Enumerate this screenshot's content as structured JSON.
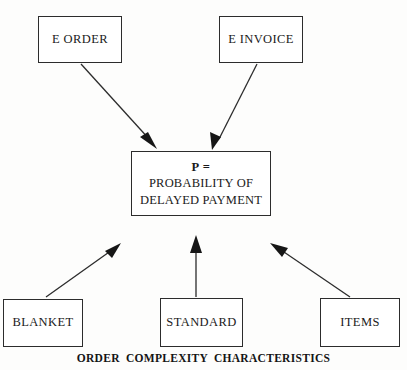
{
  "diagram": {
    "title_caption": "ORDER  COMPLEXITY  CHARACTERISTICS",
    "colors": {
      "stroke": "#2c2c2c",
      "text": "#1a1a1a",
      "background": "#fdfdfc"
    },
    "nodes": {
      "e_order": {
        "label": "E ORDER"
      },
      "e_invoice": {
        "label": "E INVOICE"
      },
      "probability": {
        "line1": "P =",
        "line2": "PROBABILITY OF",
        "line3": "DELAYED PAYMENT"
      },
      "blanket": {
        "label": "BLANKET"
      },
      "standard": {
        "label": "STANDARD"
      },
      "items": {
        "label": "ITEMS"
      }
    },
    "edges": [
      {
        "name": "e-order-to-probability",
        "from": "e_order",
        "to": "probability",
        "direction": "down-right"
      },
      {
        "name": "e-invoice-to-probability",
        "from": "e_invoice",
        "to": "probability",
        "direction": "down-left"
      },
      {
        "name": "blanket-to-probability",
        "from": "blanket",
        "to": "probability",
        "direction": "up-right"
      },
      {
        "name": "standard-to-probability",
        "from": "standard",
        "to": "probability",
        "direction": "up"
      },
      {
        "name": "items-to-probability",
        "from": "items",
        "to": "probability",
        "direction": "up-left"
      }
    ]
  }
}
